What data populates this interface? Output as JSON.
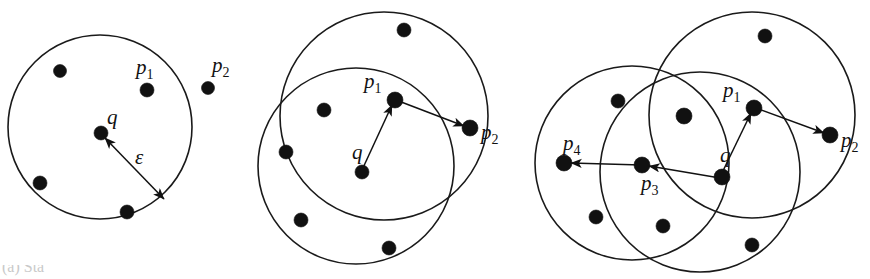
{
  "figure": {
    "background_color": "#ffffff",
    "stroke_color": "#111111",
    "width": 870,
    "height": 279,
    "caption_partial": "(a) Sta"
  },
  "panels": [
    {
      "id": "panel-a",
      "name": "single-epsilon-ball",
      "circles": [
        {
          "name": "epsilon-ball-q",
          "cx": 100,
          "cy": 127,
          "r": 92
        }
      ],
      "points": [
        {
          "name": "point-unlabeled-1",
          "cx": 60,
          "cy": 71,
          "r": 6.5,
          "label": ""
        },
        {
          "name": "point-p1",
          "cx": 147,
          "cy": 90,
          "r": 7,
          "label": "p",
          "sub": "1",
          "lx": 136,
          "ly": 74
        },
        {
          "name": "point-p2",
          "cx": 208,
          "cy": 88,
          "r": 6.5,
          "label": "p",
          "sub": "2",
          "lx": 212,
          "ly": 72
        },
        {
          "name": "point-q",
          "cx": 101,
          "cy": 133,
          "r": 7,
          "label": "q",
          "sub": "",
          "lx": 107,
          "ly": 124
        },
        {
          "name": "point-unlabeled-2",
          "cx": 40,
          "cy": 183,
          "r": 7,
          "label": ""
        },
        {
          "name": "point-unlabeled-3",
          "cx": 127,
          "cy": 212,
          "r": 7,
          "label": ""
        }
      ],
      "arrows": [
        {
          "name": "epsilon-radius-arrow",
          "x1": 105,
          "y1": 138,
          "x2": 164,
          "y2": 199,
          "double": true
        }
      ],
      "greek_labels": [
        {
          "name": "epsilon-label",
          "text": "ε",
          "x": 135,
          "y": 164,
          "size": 22
        }
      ]
    },
    {
      "id": "panel-b",
      "name": "two-overlapping-epsilon-balls",
      "circles": [
        {
          "name": "epsilon-ball-p1",
          "cx": 384,
          "cy": 116,
          "r": 104
        },
        {
          "name": "epsilon-ball-q",
          "cx": 356,
          "cy": 166,
          "r": 98
        }
      ],
      "points": [
        {
          "name": "point-unlabeled-1",
          "cx": 404,
          "cy": 30,
          "r": 7,
          "label": ""
        },
        {
          "name": "point-p1",
          "cx": 395,
          "cy": 100,
          "r": 8,
          "label": "p",
          "sub": "1",
          "lx": 364,
          "ly": 88
        },
        {
          "name": "point-unlabeled-2",
          "cx": 324,
          "cy": 110,
          "r": 7,
          "label": ""
        },
        {
          "name": "point-p2",
          "cx": 470,
          "cy": 128,
          "r": 8,
          "label": "p",
          "sub": "2",
          "lx": 481,
          "ly": 139
        },
        {
          "name": "point-unlabeled-3",
          "cx": 286,
          "cy": 152,
          "r": 7,
          "label": ""
        },
        {
          "name": "point-q",
          "cx": 362,
          "cy": 172,
          "r": 7,
          "label": "q",
          "sub": "",
          "lx": 352,
          "ly": 159
        },
        {
          "name": "point-unlabeled-4",
          "cx": 301,
          "cy": 220,
          "r": 7,
          "label": ""
        },
        {
          "name": "point-unlabeled-5",
          "cx": 389,
          "cy": 248,
          "r": 7,
          "label": ""
        }
      ],
      "arrows": [
        {
          "name": "arrow-q-to-p1",
          "x1": 362,
          "y1": 170,
          "x2": 392,
          "y2": 105,
          "double": false
        },
        {
          "name": "arrow-p1-to-p2",
          "x1": 396,
          "y1": 100,
          "x2": 464,
          "y2": 126,
          "double": false
        }
      ],
      "greek_labels": []
    },
    {
      "id": "panel-c",
      "name": "three-overlapping-epsilon-balls",
      "circles": [
        {
          "name": "epsilon-ball-p1",
          "cx": 752,
          "cy": 115,
          "r": 103
        },
        {
          "name": "epsilon-ball-p4",
          "cx": 632,
          "cy": 163,
          "r": 97
        },
        {
          "name": "epsilon-ball-q",
          "cx": 700,
          "cy": 172,
          "r": 100
        }
      ],
      "points": [
        {
          "name": "point-unlabeled-1",
          "cx": 765,
          "cy": 36,
          "r": 7,
          "label": ""
        },
        {
          "name": "point-unlabeled-2",
          "cx": 618,
          "cy": 101,
          "r": 7,
          "label": ""
        },
        {
          "name": "point-unlabeled-3",
          "cx": 684,
          "cy": 116,
          "r": 8,
          "label": ""
        },
        {
          "name": "point-p1",
          "cx": 754,
          "cy": 108,
          "r": 8,
          "label": "p",
          "sub": "1",
          "lx": 723,
          "ly": 97
        },
        {
          "name": "point-p2",
          "cx": 830,
          "cy": 135,
          "r": 8,
          "label": "p",
          "sub": "2",
          "lx": 841,
          "ly": 147
        },
        {
          "name": "point-p4",
          "cx": 564,
          "cy": 163,
          "r": 8,
          "label": "p",
          "sub": "4",
          "lx": 563,
          "ly": 150
        },
        {
          "name": "point-p3",
          "cx": 642,
          "cy": 165,
          "r": 8,
          "label": "p",
          "sub": "3",
          "lx": 641,
          "ly": 190
        },
        {
          "name": "point-q",
          "cx": 722,
          "cy": 177,
          "r": 8,
          "label": "q",
          "sub": "",
          "lx": 720,
          "ly": 162
        },
        {
          "name": "point-unlabeled-4",
          "cx": 596,
          "cy": 217,
          "r": 7,
          "label": ""
        },
        {
          "name": "point-unlabeled-5",
          "cx": 663,
          "cy": 226,
          "r": 7,
          "label": ""
        },
        {
          "name": "point-unlabeled-6",
          "cx": 752,
          "cy": 245,
          "r": 7,
          "label": ""
        }
      ],
      "arrows": [
        {
          "name": "arrow-q-to-p1",
          "x1": 721,
          "y1": 175,
          "x2": 751,
          "y2": 113,
          "double": false
        },
        {
          "name": "arrow-p1-to-p2",
          "x1": 756,
          "y1": 108,
          "x2": 824,
          "y2": 133,
          "double": false
        },
        {
          "name": "arrow-q-to-p3",
          "x1": 720,
          "y1": 178,
          "x2": 649,
          "y2": 166,
          "double": false
        },
        {
          "name": "arrow-p3-to-p4",
          "x1": 641,
          "y1": 165,
          "x2": 571,
          "y2": 163,
          "double": false
        }
      ],
      "greek_labels": []
    }
  ]
}
